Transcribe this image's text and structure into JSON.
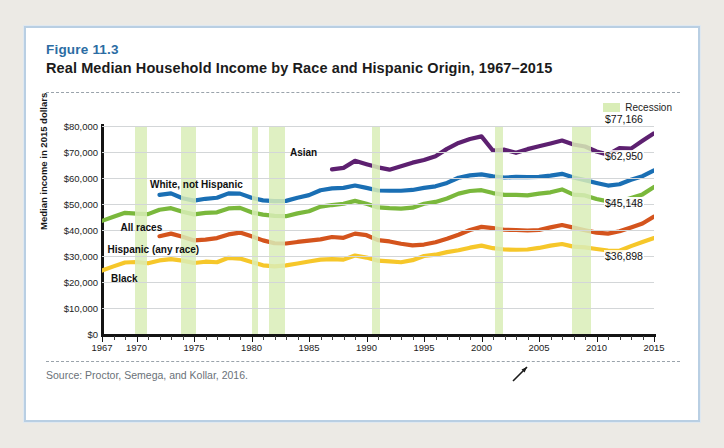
{
  "figure": {
    "label": "Figure 11.3",
    "title": "Real Median Household Income by Race and Hispanic Origin, 1967–2015",
    "source": "Source: Proctor, Semega, and Kollar, 2016."
  },
  "legend": {
    "recession_label": "Recession",
    "recession_color": "#d9edb7"
  },
  "chart_data": {
    "type": "line",
    "title": "Real Median Household Income by Race and Hispanic Origin, 1967–2015",
    "xlabel": "",
    "ylabel": "Median income in 2015 dollars",
    "xlim": [
      1967,
      2015
    ],
    "ylim": [
      0,
      80000
    ],
    "ytick_labels": [
      "$80,000",
      "$70,000",
      "$60,000",
      "$50,000",
      "$40,000",
      "$30,000",
      "$20,000",
      "$10,000",
      "$0"
    ],
    "yticks": [
      80000,
      70000,
      60000,
      50000,
      40000,
      30000,
      20000,
      10000,
      0
    ],
    "xtick_labels": [
      "1967",
      "1970",
      "1975",
      "1980",
      "1985",
      "1990",
      "1995",
      "2000",
      "2005",
      "2010",
      "2015"
    ],
    "xticks": [
      1967,
      1970,
      1975,
      1980,
      1985,
      1990,
      1995,
      2000,
      2005,
      2010,
      2015
    ],
    "grid": true,
    "legend_position": "top-right",
    "recession_bands": [
      [
        1969.9,
        1970.9
      ],
      [
        1973.9,
        1975.2
      ],
      [
        1980.0,
        1980.6
      ],
      [
        1981.5,
        1982.9
      ],
      [
        1990.5,
        1991.2
      ],
      [
        2001.2,
        2001.9
      ],
      [
        2007.9,
        2009.5
      ]
    ],
    "series": [
      {
        "name": "Asian",
        "color": "#5d2070",
        "label_x": 1987,
        "end_value": 77166,
        "end_label": "$77,166",
        "x": [
          1987,
          1988,
          1989,
          1990,
          1991,
          1992,
          1993,
          1994,
          1995,
          1996,
          1997,
          1998,
          1999,
          2000,
          2001,
          2002,
          2003,
          2004,
          2005,
          2006,
          2007,
          2008,
          2009,
          2010,
          2011,
          2012,
          2013,
          2014,
          2015
        ],
        "values": [
          63300,
          63900,
          66600,
          65300,
          64100,
          63200,
          64500,
          65900,
          66900,
          68400,
          71200,
          73500,
          75000,
          76000,
          70500,
          70900,
          69700,
          71100,
          72200,
          73300,
          74400,
          72900,
          72100,
          70200,
          69000,
          71500,
          71300,
          74300,
          77166
        ]
      },
      {
        "name": "White, not Hispanic",
        "color": "#1a6fb4",
        "label_x": 1975,
        "end_value": 62950,
        "end_label": "$62,950",
        "x": [
          1972,
          1973,
          1974,
          1975,
          1976,
          1977,
          1978,
          1979,
          1980,
          1981,
          1982,
          1983,
          1984,
          1985,
          1986,
          1987,
          1988,
          1989,
          1990,
          1991,
          1992,
          1993,
          1994,
          1995,
          1996,
          1997,
          1998,
          1999,
          2000,
          2001,
          2002,
          2003,
          2004,
          2005,
          2006,
          2007,
          2008,
          2009,
          2010,
          2011,
          2012,
          2013,
          2014,
          2015
        ],
        "values": [
          53500,
          54100,
          52200,
          51300,
          52000,
          52400,
          54100,
          54000,
          52400,
          51400,
          51100,
          51200,
          52400,
          53400,
          55300,
          56000,
          56200,
          57100,
          56200,
          55200,
          55100,
          55100,
          55400,
          56200,
          56800,
          58100,
          60100,
          61000,
          61400,
          60600,
          60200,
          60400,
          60300,
          60400,
          60900,
          61600,
          60200,
          59200,
          58100,
          57100,
          57600,
          59300,
          60700,
          62950
        ]
      },
      {
        "name": "All races",
        "color": "#7ab83c",
        "label_x": 1970,
        "end_value": 56516,
        "end_label": "$56,516",
        "x": [
          1967,
          1968,
          1969,
          1970,
          1971,
          1972,
          1973,
          1974,
          1975,
          1976,
          1977,
          1978,
          1979,
          1980,
          1981,
          1982,
          1983,
          1984,
          1985,
          1986,
          1987,
          1988,
          1989,
          1990,
          1991,
          1992,
          1993,
          1994,
          1995,
          1996,
          1997,
          1998,
          1999,
          2000,
          2001,
          2002,
          2003,
          2004,
          2005,
          2006,
          2007,
          2008,
          2009,
          2010,
          2011,
          2012,
          2013,
          2014,
          2015
        ],
        "values": [
          43500,
          45100,
          46600,
          46300,
          46100,
          47800,
          48400,
          47000,
          46000,
          46600,
          46800,
          48300,
          48500,
          46800,
          45900,
          45400,
          45300,
          46400,
          47200,
          49000,
          49600,
          50100,
          51200,
          50100,
          48700,
          48400,
          48200,
          48600,
          50100,
          50800,
          52100,
          54000,
          55000,
          55300,
          54200,
          53500,
          53500,
          53300,
          54000,
          54500,
          55600,
          53600,
          53300,
          51900,
          51000,
          51000,
          52300,
          53700,
          56516
        ]
      },
      {
        "name": "Hispanic (any race)",
        "color": "#d4541d",
        "label_x": 1972,
        "end_value": 45148,
        "end_label": "$45,148",
        "x": [
          1972,
          1973,
          1974,
          1975,
          1976,
          1977,
          1978,
          1979,
          1980,
          1981,
          1982,
          1983,
          1984,
          1985,
          1986,
          1987,
          1988,
          1989,
          1990,
          1991,
          1992,
          1993,
          1994,
          1995,
          1996,
          1997,
          1998,
          1999,
          2000,
          2001,
          2002,
          2003,
          2004,
          2005,
          2006,
          2007,
          2008,
          2009,
          2010,
          2011,
          2012,
          2013,
          2014,
          2015
        ],
        "values": [
          37600,
          38600,
          37400,
          36000,
          36300,
          36900,
          38300,
          39000,
          37600,
          36000,
          34900,
          34800,
          35400,
          35900,
          36400,
          37300,
          37000,
          38600,
          38000,
          36100,
          35600,
          34700,
          34100,
          34400,
          35300,
          36600,
          38200,
          40000,
          41200,
          40700,
          40100,
          40000,
          39800,
          40000,
          41000,
          41900,
          40900,
          39900,
          39000,
          38600,
          39500,
          41000,
          42500,
          45148
        ]
      },
      {
        "name": "Black",
        "color": "#f6c72a",
        "label_x": 1969,
        "end_value": 36898,
        "end_label": "$36,898",
        "x": [
          1967,
          1968,
          1969,
          1970,
          1971,
          1972,
          1973,
          1974,
          1975,
          1976,
          1977,
          1978,
          1979,
          1980,
          1981,
          1982,
          1983,
          1984,
          1985,
          1986,
          1987,
          1988,
          1989,
          1990,
          1991,
          1992,
          1993,
          1994,
          1995,
          1996,
          1997,
          1998,
          1999,
          2000,
          2001,
          2002,
          2003,
          2004,
          2005,
          2006,
          2007,
          2008,
          2009,
          2010,
          2011,
          2012,
          2013,
          2014,
          2015
        ],
        "values": [
          24400,
          26000,
          27500,
          27700,
          27200,
          28300,
          28800,
          28200,
          27300,
          27800,
          27600,
          29300,
          29000,
          27700,
          26400,
          26000,
          26400,
          27100,
          27900,
          28600,
          28800,
          28600,
          30200,
          29400,
          28200,
          27900,
          27600,
          28400,
          30000,
          30500,
          31500,
          32200,
          33200,
          34000,
          33000,
          32500,
          32400,
          32500,
          33100,
          34000,
          34600,
          33600,
          33300,
          32700,
          32100,
          32000,
          33800,
          35400,
          36898
        ]
      }
    ]
  }
}
